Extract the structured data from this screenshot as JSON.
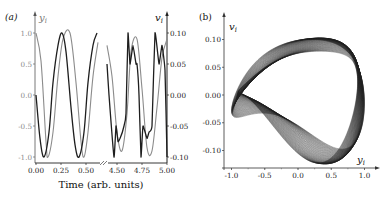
{
  "chart_data": [
    {
      "type": "line",
      "panel_label": "(a)",
      "xlabel": "Time (arb. units)",
      "x_ticks": [
        "0.00",
        "0.25",
        "0.50",
        "4.50",
        "4.75",
        "5.00"
      ],
      "x_axis_break": "between 0.50 and 4.50 (break mark //)",
      "left_ylabel": "y_i",
      "left_y_ticks": [
        "1.0",
        "0.5",
        "0.0",
        "-0.5",
        "-1.0"
      ],
      "left_ylim": [
        -1.0,
        1.0
      ],
      "right_ylabel": "v_i",
      "right_y_ticks": [
        "0.10",
        "0.05",
        "0.00",
        "-0.05",
        "-0.10"
      ],
      "right_ylim": [
        -0.1,
        0.1
      ],
      "grid": false,
      "series": [
        {
          "name": "y_i",
          "axis": "left",
          "color": "#8c8c8c",
          "segment1": {
            "t": [
              0.0,
              0.05,
              0.1,
              0.12,
              0.17,
              0.22,
              0.27,
              0.34,
              0.4,
              0.45,
              0.48,
              0.52,
              0.57,
              0.62
            ],
            "values": [
              1.0,
              0.55,
              -0.75,
              -1.0,
              -0.6,
              0.3,
              0.9,
              1.0,
              0.2,
              -0.75,
              -1.0,
              -0.6,
              0.3,
              0.85
            ]
          },
          "segment2": {
            "t": [
              4.4,
              4.45,
              4.5,
              4.55,
              4.6,
              4.64,
              4.7,
              4.75,
              4.8,
              4.85,
              4.9,
              4.95,
              5.0
            ],
            "values": [
              0.8,
              0.3,
              -0.6,
              -0.9,
              -0.3,
              0.7,
              0.9,
              0.1,
              -0.85,
              -0.9,
              -0.2,
              0.6,
              0.9
            ]
          }
        },
        {
          "name": "v_i",
          "axis": "right",
          "color": "#1e1e1e",
          "segment1": {
            "t": [
              0.0,
              0.04,
              0.08,
              0.13,
              0.17,
              0.22,
              0.26,
              0.3,
              0.35,
              0.39,
              0.43,
              0.48,
              0.52,
              0.57,
              0.61
            ],
            "values": [
              0.0,
              -0.07,
              -0.1,
              -0.06,
              0.02,
              0.08,
              0.1,
              0.07,
              -0.02,
              -0.08,
              -0.1,
              -0.06,
              0.02,
              0.08,
              0.1
            ]
          },
          "segment2": {
            "t": [
              4.4,
              4.42,
              4.47,
              4.49,
              4.51,
              4.53,
              4.57,
              4.59,
              4.61,
              4.63,
              4.66,
              4.69,
              4.7,
              4.72,
              4.74,
              4.76,
              4.8,
              4.82,
              4.85,
              4.88,
              4.92,
              4.95,
              4.98,
              5.0
            ],
            "values": [
              0.05,
              0.0,
              -0.1,
              -0.05,
              -0.075,
              -0.07,
              -0.05,
              -0.03,
              0.1,
              0.05,
              0.08,
              0.05,
              0.05,
              0.0,
              -0.1,
              -0.05,
              -0.07,
              -0.06,
              -0.05,
              0.1,
              0.05,
              0.08,
              0.04,
              -0.1
            ]
          }
        }
      ]
    },
    {
      "type": "line",
      "subtype": "phase-portrait",
      "panel_label": "(b)",
      "xlabel": "y_i",
      "ylabel": "v_i",
      "x_ticks": [
        "-1.0",
        "-0.5",
        "0.0",
        "0.5",
        "1.0"
      ],
      "y_ticks": [
        "0.10",
        "0.05",
        "0.00",
        "-0.05",
        "-0.10"
      ],
      "xlim": [
        -1.05,
        1.05
      ],
      "ylim": [
        -0.125,
        0.13
      ],
      "grid": false,
      "description": "Dense family of closed loops (v_i vs y_i) forming two interleaved figure-eight-like ribbon bands; outer envelope spans y_i in [-1.0, 1.0] and v_i roughly in [-0.12, 0.12]",
      "color": "#1e1e1e",
      "loop_count": 60
    }
  ],
  "panel_a": {
    "label": "(a)",
    "left_var": "y",
    "left_sub": "i",
    "right_var": "v",
    "right_sub": "i",
    "xlabel": "Time (arb. units)",
    "left_ticks": [
      "1.0",
      "0.5",
      "0.0",
      "-0.5",
      "-1.0"
    ],
    "right_ticks": [
      "0.10",
      "0.05",
      "0.00",
      "-0.05",
      "-0.10"
    ],
    "x_ticks": [
      "0.00",
      "0.25",
      "0.50",
      "4.50",
      "4.75",
      "5.00"
    ]
  },
  "panel_b": {
    "label": "(b)",
    "y_var": "v",
    "y_sub": "i",
    "x_var": "y",
    "x_sub": "i",
    "y_ticks": [
      "0.10",
      "0.05",
      "0.00",
      "-0.05",
      "-0.10"
    ],
    "x_ticks": [
      "-1.0",
      "-0.5",
      "0.0",
      "0.5",
      "1.0"
    ]
  }
}
